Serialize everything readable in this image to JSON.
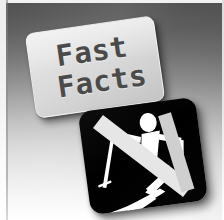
{
  "image": {
    "kind": "promotional-graphic",
    "title_card": {
      "line1": "Fast",
      "line2": "Facts"
    },
    "icon_tile": {
      "pictogram": "downhill-skier",
      "pictogram_parts": [
        "head",
        "torso",
        "arms",
        "legs",
        "left-ski-pole",
        "right-ski-pole",
        "skis"
      ]
    },
    "colors": {
      "background_top": "#4f4f4f",
      "background_bottom": "#ffffff",
      "card_face": "#dedede",
      "card_text": "#4a4a4a",
      "tile_background": "#000000",
      "pictogram": "#ffffff",
      "edge_line": "#8c8c8c"
    }
  }
}
